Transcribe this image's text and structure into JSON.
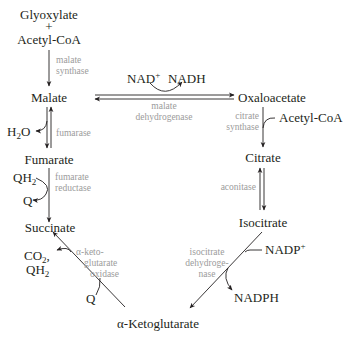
{
  "colors": {
    "text": "#231f20",
    "enzyme_text": "#9b9b9b",
    "arrow": "#231f20",
    "background": "#ffffff"
  },
  "metabolites": {
    "glyoxylate": "Glyoxylate",
    "plus": "+",
    "acetyl_coa_top": "Acetyl-CoA",
    "malate": "Malate",
    "oxaloacetate": "Oxaloacetate",
    "acetyl_coa_right": "Acetyl-CoA",
    "citrate": "Citrate",
    "isocitrate": "Isocitrate",
    "alpha_ketoglutarate": "α-Ketoglutarate",
    "succinate": "Succinate",
    "fumarate": "Fumarate"
  },
  "cofactors": {
    "nad": "NAD",
    "nad_sup": "+",
    "nadh": "NADH",
    "h2o_h": "H",
    "h2o_sub": "2",
    "h2o_o": "O",
    "qh2_top_q": "QH",
    "qh2_top_sub": "2",
    "q_top": "Q",
    "co2_c": "CO",
    "co2_sub": "2",
    "co2_comma": ",",
    "qh2_bottom_q": "QH",
    "qh2_bottom_sub": "2",
    "q_bottom": "Q",
    "nadp": "NADP",
    "nadp_sup": "+",
    "nadph": "NADPH"
  },
  "enzymes": {
    "malate_synthase": [
      "malate",
      "synthase"
    ],
    "malate_dehydrogenase": [
      "malate",
      "dehydrogenase"
    ],
    "fumarase": [
      "fumarase"
    ],
    "fumarate_reductase": [
      "fumarate",
      "reductase"
    ],
    "citrate_synthase": [
      "citrate",
      "synthase"
    ],
    "aconitase": [
      "aconitase"
    ],
    "isocitrate_dehydrogenase": [
      "isocitrate",
      "dehydroge-",
      "nase"
    ],
    "akg_oxidase": [
      "α-keto-",
      "glutarate",
      "oxidase"
    ]
  }
}
